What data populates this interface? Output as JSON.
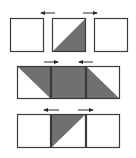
{
  "colors": {
    "background": "#ffffff",
    "stroke": "#3a3a3a",
    "fill": "#707070",
    "arrow": "#2a2a2a"
  },
  "rows": [
    {
      "name": "row-1",
      "cells": [
        {
          "x": 10,
          "y": 18,
          "w": 34,
          "h": 34,
          "shade": "none"
        },
        {
          "x": 52,
          "y": 18,
          "w": 34,
          "h": 34,
          "shade": "lower-right"
        },
        {
          "x": 94,
          "y": 18,
          "w": 34,
          "h": 34,
          "shade": "none"
        }
      ],
      "arrows": [
        {
          "x1": 55,
          "x2": 41,
          "y": 13,
          "direction": "left"
        },
        {
          "x1": 83,
          "x2": 97,
          "y": 13,
          "direction": "right"
        }
      ]
    },
    {
      "name": "row-2",
      "cells": [
        {
          "x": 17,
          "y": 66,
          "w": 34,
          "h": 33,
          "shade": "upper-right"
        },
        {
          "x": 51,
          "y": 66,
          "w": 35,
          "h": 33,
          "shade": "full"
        },
        {
          "x": 86,
          "y": 66,
          "w": 34,
          "h": 33,
          "shade": "lower-left"
        }
      ],
      "arrows": [
        {
          "x1": 44,
          "x2": 58,
          "y": 62,
          "direction": "right"
        },
        {
          "x1": 93,
          "x2": 79,
          "y": 62,
          "direction": "left"
        }
      ]
    },
    {
      "name": "row-3",
      "cells": [
        {
          "x": 17,
          "y": 114,
          "w": 34,
          "h": 34,
          "shade": "none"
        },
        {
          "x": 51,
          "y": 114,
          "w": 35,
          "h": 34,
          "shade": "upper-left"
        },
        {
          "x": 86,
          "y": 114,
          "w": 34,
          "h": 34,
          "shade": "none"
        }
      ],
      "arrows": [
        {
          "x1": 59,
          "x2": 44,
          "y": 110,
          "direction": "left"
        },
        {
          "x1": 78,
          "x2": 93,
          "y": 110,
          "direction": "right"
        }
      ]
    }
  ]
}
